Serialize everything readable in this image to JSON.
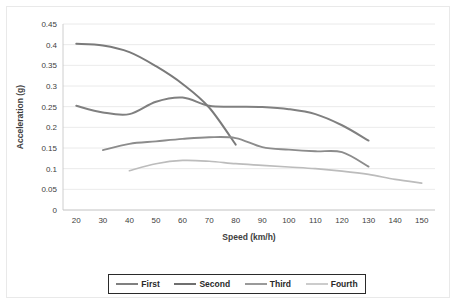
{
  "chart_data": {
    "type": "line",
    "title": "",
    "xlabel": "Speed (km/h)",
    "ylabel": "Acceleration (g)",
    "xlim": [
      15,
      155
    ],
    "ylim": [
      0,
      0.45
    ],
    "xticks": [
      20,
      30,
      40,
      50,
      60,
      70,
      80,
      90,
      100,
      110,
      120,
      130,
      140,
      150
    ],
    "yticks": [
      0,
      0.05,
      0.1,
      0.15,
      0.2,
      0.25,
      0.3,
      0.35,
      0.4,
      0.45
    ],
    "ytick_labels": [
      "0",
      "0.05",
      "0.1",
      "0.15",
      "0.2",
      "0.25",
      "0.3",
      "0.35",
      "0.4",
      "0.45"
    ],
    "grid": "horizontal",
    "legend_position": "bottom",
    "series": [
      {
        "name": "First",
        "color": "#808080",
        "x": [
          20,
          30,
          40,
          50,
          60,
          70,
          80,
          90,
          100,
          110,
          120,
          130
        ],
        "values": [
          0.252,
          0.236,
          0.232,
          0.262,
          0.272,
          0.252,
          0.25,
          0.249,
          0.244,
          0.232,
          0.205,
          0.168
        ]
      },
      {
        "name": "Second",
        "color": "#7a7a7a",
        "x": [
          20,
          30,
          40,
          50,
          60,
          70,
          80
        ],
        "values": [
          0.402,
          0.398,
          0.382,
          0.348,
          0.305,
          0.248,
          0.158
        ]
      },
      {
        "name": "Third",
        "color": "#8c8c8c",
        "x": [
          30,
          40,
          50,
          60,
          70,
          80,
          90,
          100,
          110,
          120,
          130
        ],
        "values": [
          0.145,
          0.16,
          0.166,
          0.172,
          0.176,
          0.174,
          0.152,
          0.146,
          0.142,
          0.14,
          0.105
        ]
      },
      {
        "name": "Fourth",
        "color": "#bcbcbc",
        "x": [
          40,
          50,
          60,
          70,
          80,
          90,
          100,
          110,
          120,
          130,
          140,
          150
        ],
        "values": [
          0.095,
          0.112,
          0.12,
          0.118,
          0.112,
          0.108,
          0.104,
          0.1,
          0.094,
          0.086,
          0.074,
          0.065
        ]
      }
    ]
  },
  "legend": {
    "items": [
      {
        "label": "First",
        "color": "#808080"
      },
      {
        "label": "Second",
        "color": "#6f6f6f"
      },
      {
        "label": "Third",
        "color": "#9a9a9a"
      },
      {
        "label": "Fourth",
        "color": "#cccccc"
      }
    ]
  }
}
